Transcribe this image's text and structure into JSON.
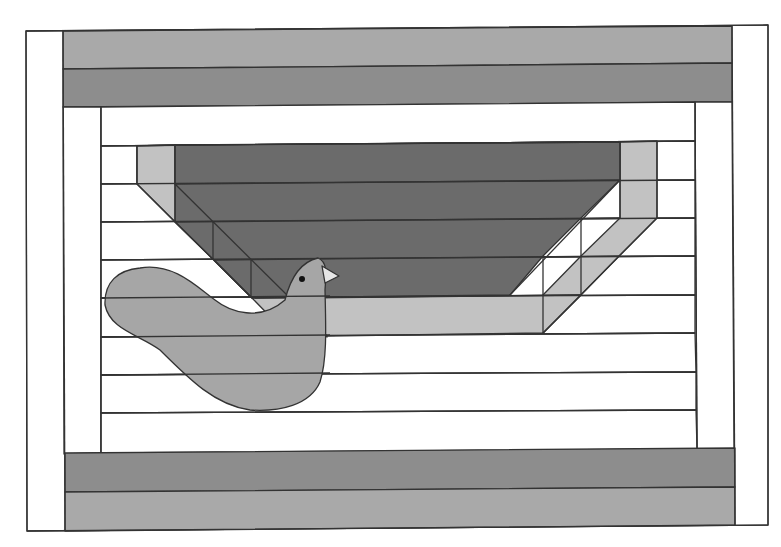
{
  "diagram": {
    "colors": {
      "background": "#ffffff",
      "stroke": "#333333",
      "border_light": "#a9a9a9",
      "border_dark": "#8d8d8d",
      "basket_dark": "#6b6b6b",
      "basket_light": "#c2c2c2",
      "bird": "#a6a6a6",
      "beak": "#e6e6e6",
      "eye": "#111111",
      "white": "#ffffff"
    },
    "components": [
      "outer-white-frame",
      "top-border-light-strip",
      "top-border-dark-strip",
      "bottom-border-dark-strip",
      "bottom-border-light-strip",
      "inner-white-frame",
      "horizontal-strips",
      "basket",
      "bird"
    ]
  }
}
